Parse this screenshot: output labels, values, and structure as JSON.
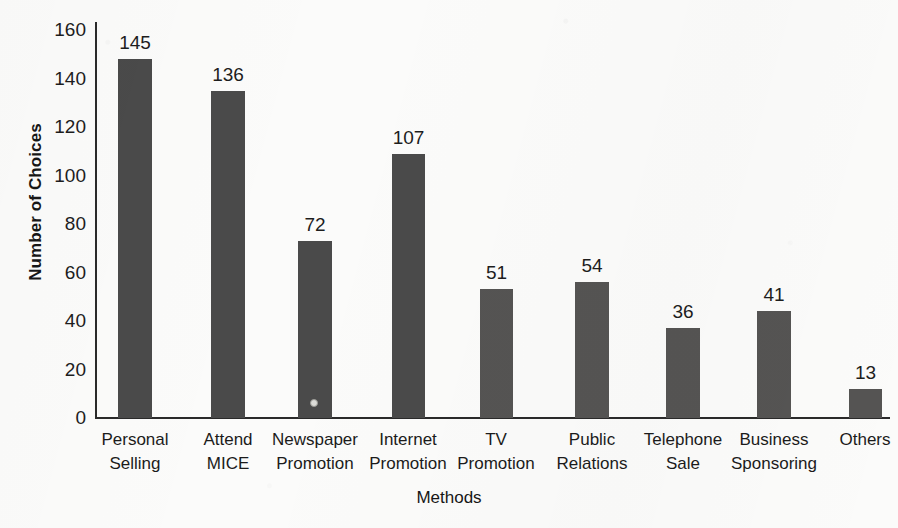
{
  "chart_data": {
    "type": "bar",
    "title": "",
    "xlabel": "Methods",
    "ylabel": "Number of Choices",
    "categories": [
      "Personal Selling",
      "Attend MICE",
      "Newspaper Promotion",
      "Internet Promotion",
      "TV Promotion",
      "Public Relations",
      "Telephone Sale",
      "Business Sponsoring",
      "Others"
    ],
    "category_lines": [
      [
        "Personal",
        "Selling"
      ],
      [
        "Attend",
        "MICE"
      ],
      [
        "Newspaper",
        "Promotion"
      ],
      [
        "Internet",
        "Promotion"
      ],
      [
        "TV",
        "Promotion"
      ],
      [
        "Public",
        "Relations"
      ],
      [
        "Telephone",
        "Sale"
      ],
      [
        "Business",
        "Sponsoring"
      ],
      [
        "Others",
        ""
      ]
    ],
    "values": [
      145,
      136,
      72,
      107,
      51,
      54,
      36,
      41,
      13
    ],
    "plotted_heights": [
      148,
      135,
      73,
      109,
      53,
      56,
      37,
      44,
      12
    ],
    "data_labels": [
      "145",
      "136",
      "72",
      "107",
      "51",
      "54",
      "36",
      "41",
      "13"
    ],
    "ylim": [
      0,
      160
    ],
    "y_ticks": [
      0,
      20,
      40,
      60,
      80,
      100,
      120,
      140,
      160
    ],
    "y_tick_labels": [
      "0",
      "20",
      "40",
      "60",
      "80",
      "100",
      "120",
      "140",
      "160"
    ],
    "grid": false,
    "legend": null,
    "bar_color": "#4a4a4a",
    "bar_color_light": "#555453",
    "axis_color": "#2a2a2a",
    "background_color": "#fbfbfa"
  },
  "geometry": {
    "plot_left": 95,
    "plot_baseline_y": 418,
    "plot_top_y": 30,
    "px_per_unit": 2.425,
    "bar_slots": [
      {
        "x": 118,
        "width": 34,
        "light": false
      },
      {
        "x": 211,
        "width": 34,
        "light": false
      },
      {
        "x": 298,
        "width": 34,
        "light": false
      },
      {
        "x": 392,
        "width": 33,
        "light": false
      },
      {
        "x": 480,
        "width": 33,
        "light": true
      },
      {
        "x": 575,
        "width": 34,
        "light": true
      },
      {
        "x": 666,
        "width": 34,
        "light": true
      },
      {
        "x": 757,
        "width": 34,
        "light": true
      },
      {
        "x": 849,
        "width": 33,
        "light": true
      }
    ],
    "y_tick_positions": [
      418,
      370,
      321,
      273,
      224,
      176,
      127,
      79,
      30
    ],
    "label_centers": [
      135,
      228,
      315,
      408,
      496,
      592,
      683,
      774,
      865
    ]
  }
}
